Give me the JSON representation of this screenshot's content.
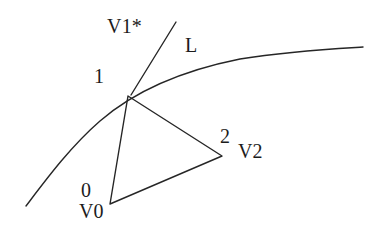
{
  "figure": {
    "background_color": "#ffffff",
    "stroke_color": "#262626",
    "text_color": "#1c1c1c",
    "width": 381,
    "height": 243,
    "labels": {
      "v1_star": "V1*",
      "line_l": "L",
      "node_one": "1",
      "node_two": "2",
      "vertex_v2": "V2",
      "node_zero": "0",
      "vertex_v0": "V0"
    },
    "geometry": {
      "curve_label": "L",
      "curve_path": "M 26 206 C 45 181 70 147 100 121 C 130 95 175 72 240 59 C 290 51 330 49 363 47",
      "ray_v1star_path": "M 131 95 L 176 22",
      "triangle_path": "M 128 96 L 110 204 L 222 156 Z",
      "triangle_vertices": [
        {
          "name": "1",
          "x": 128,
          "y": 96
        },
        {
          "name": "0",
          "x": 110,
          "y": 204
        },
        {
          "name": "2",
          "x": 222,
          "y": 156
        }
      ],
      "stroke_width": 1.4
    }
  }
}
